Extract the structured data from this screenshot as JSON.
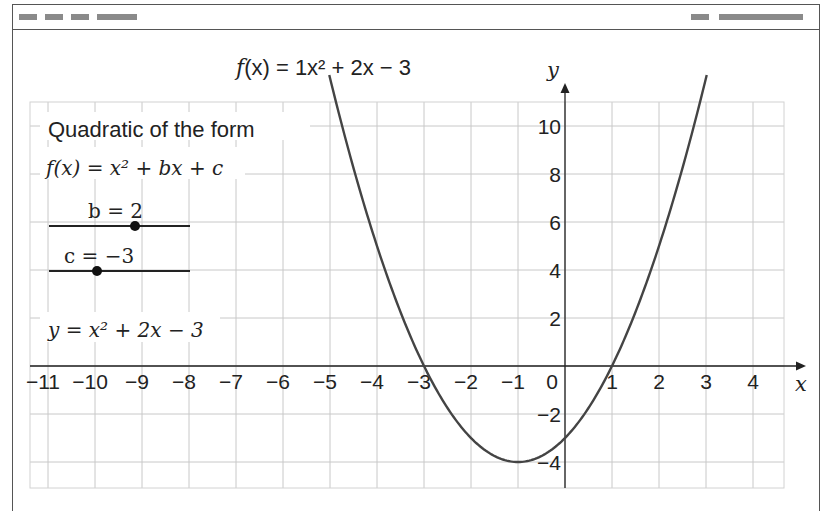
{
  "titlebar": {
    "left_blocks": [
      {
        "name": "menu-item-1",
        "x": 18,
        "w": 18
      },
      {
        "name": "menu-item-2",
        "x": 44,
        "w": 18
      },
      {
        "name": "menu-item-3",
        "x": 70,
        "w": 18
      },
      {
        "name": "menu-item-4",
        "x": 96,
        "w": 40
      }
    ],
    "right_blocks": [
      {
        "name": "status-item-1",
        "x": 690,
        "w": 18
      },
      {
        "name": "status-item-2",
        "x": 718,
        "w": 84
      }
    ]
  },
  "graph": {
    "function_label_f": "f",
    "function_label": "(x) = 1x² + 2x − 3",
    "x_axis_label": "x",
    "y_axis_label": "y",
    "x_ticks": [
      "−11",
      "−10",
      "−9",
      "−8",
      "−7",
      "−6",
      "−5",
      "−4",
      "−3",
      "−2",
      "−1",
      "0",
      "1",
      "2",
      "3",
      "4"
    ],
    "y_ticks": [
      "10",
      "8",
      "6",
      "4",
      "2",
      "−2",
      "−4"
    ],
    "curve_color": "#444444",
    "grid_color": "#c8c8c8"
  },
  "panel": {
    "heading": "Quadratic of the form",
    "general_form": "f(x) = x² + bx + c",
    "slider_b": {
      "label": "b = 2",
      "name": "b",
      "value": 2,
      "min": -5,
      "max": 5
    },
    "slider_c": {
      "label": "c = −3",
      "name": "c",
      "value": -3,
      "min": -5,
      "max": 5
    },
    "result_equation": "y = x² + 2x − 3"
  },
  "chart_data": {
    "type": "line",
    "title": "f(x) = 1x² + 2x − 3",
    "xlabel": "x",
    "ylabel": "y",
    "xlim": [
      -11.3,
      4.7
    ],
    "ylim": [
      -5,
      11
    ],
    "grid": true,
    "x_ticks": [
      -11,
      -10,
      -9,
      -8,
      -7,
      -6,
      -5,
      -4,
      -3,
      -2,
      -1,
      0,
      1,
      2,
      3,
      4
    ],
    "y_ticks": [
      -4,
      -2,
      2,
      4,
      6,
      8,
      10
    ],
    "series": [
      {
        "name": "f(x) = x² + 2x − 3",
        "x": [
          -5,
          -4,
          -3,
          -2,
          -1,
          0,
          1,
          2,
          3
        ],
        "values": [
          12,
          5,
          0,
          -3,
          -4,
          -3,
          0,
          5,
          12
        ]
      }
    ],
    "annotations": [
      "vertex at (−1, −4)",
      "roots at x = −3 and x = 1",
      "y-intercept −3"
    ]
  }
}
